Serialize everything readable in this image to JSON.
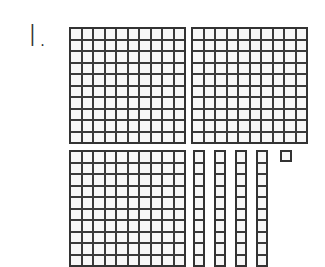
{
  "problem": {
    "number_label": "I.",
    "representation": "base-ten blocks",
    "hundreds_count": 3,
    "tens_count": 4,
    "ones_count": 1,
    "represented_value": 341
  },
  "colors": {
    "line": "#333333",
    "cell": "#f7f7f7",
    "background": "#ffffff"
  }
}
